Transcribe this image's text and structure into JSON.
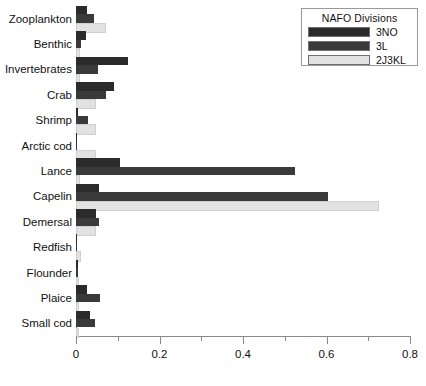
{
  "chart_data": {
    "type": "bar",
    "orientation": "horizontal",
    "title": "",
    "xlabel": "",
    "ylabel": "",
    "xlim": [
      0,
      0.8
    ],
    "grid": false,
    "x_ticks_major": [
      "0",
      "0.2",
      "0.4",
      "0.6",
      "0.8"
    ],
    "x_ticks_major_values": [
      0,
      0.2,
      0.4,
      0.6,
      0.8
    ],
    "x_ticks_minor_values": [
      0.1,
      0.3,
      0.5,
      0.7
    ],
    "categories": [
      "Zooplankton",
      "Benthic",
      "Invertebrates",
      "Crab",
      "Shrimp",
      "Arctic cod",
      "Lance",
      "Capelin",
      "Demersal",
      "Redfish",
      "Flounder",
      "Plaice",
      "Small cod"
    ],
    "series": [
      {
        "name": "3NO",
        "color": "#2b2b2b",
        "values": [
          0.026,
          0.024,
          0.124,
          0.091,
          0.004,
          0.002,
          0.105,
          0.055,
          0.048,
          0.003,
          0.004,
          0.026,
          0.034
        ]
      },
      {
        "name": "3L",
        "color": "#3a3a3a",
        "values": [
          0.043,
          0.012,
          0.053,
          0.072,
          0.029,
          0.002,
          0.525,
          0.603,
          0.055,
          0.003,
          0.005,
          0.057,
          0.045
        ]
      },
      {
        "name": "2J3KL",
        "color": "#e2e2e2",
        "values": [
          0.067,
          0.005,
          0.005,
          0.043,
          0.043,
          0.043,
          0.004,
          0.72,
          0.043,
          0.006,
          0.002,
          0.002,
          0.002
        ]
      }
    ],
    "legend": {
      "title": "NAFO Divisions",
      "position": "top-right",
      "entries": [
        {
          "label": "3NO",
          "color": "#2b2b2b"
        },
        {
          "label": "3L",
          "color": "#3a3a3a"
        },
        {
          "label": "2J3KL",
          "color": "#e2e2e2"
        }
      ]
    }
  }
}
